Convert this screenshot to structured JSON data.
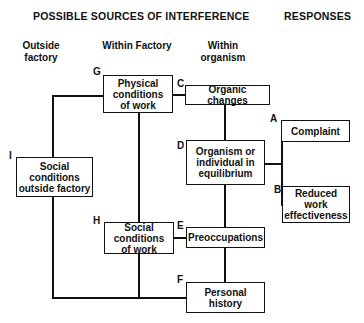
{
  "headers": {
    "sources": "POSSIBLE SOURCES OF INTERFERENCE",
    "responses": "RESPONSES"
  },
  "columns": {
    "outside": "Outside factory",
    "factory": "Within Factory",
    "organism": "Within organism"
  },
  "nodes": {
    "G": {
      "letter": "G",
      "text": "Physical conditions of work"
    },
    "C": {
      "letter": "C",
      "text": "Organic changes"
    },
    "I": {
      "letter": "I",
      "text": "Social conditions outside factory"
    },
    "D": {
      "letter": "D",
      "text": "Organism or individual in equilibrium"
    },
    "A": {
      "letter": "A",
      "text": "Complaint"
    },
    "B": {
      "letter": "B",
      "text": "Reduced work effectiveness"
    },
    "H": {
      "letter": "H",
      "text": "Social conditions of work"
    },
    "E": {
      "letter": "E",
      "text": "Preoccupations"
    },
    "F": {
      "letter": "F",
      "text": "Personal history"
    }
  }
}
